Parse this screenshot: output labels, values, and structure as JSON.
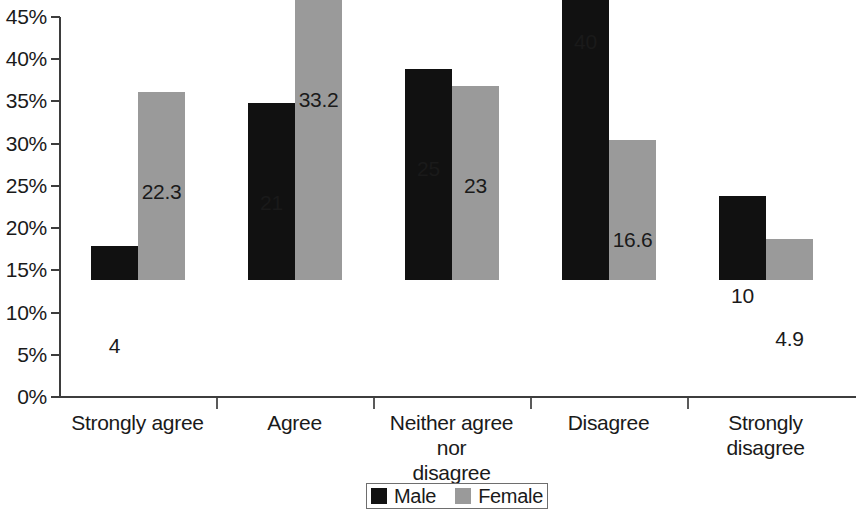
{
  "chart_data": {
    "type": "bar",
    "title": "",
    "subtitle": "",
    "xlabel": "",
    "ylabel": "",
    "categories": [
      "Strongly agree",
      "Agree",
      "Neither agree nor disagree",
      "Disagree",
      "Strongly disagree"
    ],
    "series": [
      {
        "name": "Male",
        "color": "#111111",
        "values": [
          4,
          21,
          25,
          40,
          10
        ],
        "labels": [
          "4",
          "21",
          "25",
          "40",
          "10"
        ]
      },
      {
        "name": "Female",
        "color": "#9a9a9a",
        "values": [
          22.3,
          33.2,
          23,
          16.6,
          4.9
        ],
        "labels": [
          "22.3",
          "33.2",
          "23",
          "16.6",
          "4.9"
        ]
      }
    ],
    "ylim": [
      0,
      45
    ],
    "ytick_step": 5,
    "ytick_labels": [
      "0%",
      "5%",
      "10%",
      "15%",
      "20%",
      "25%",
      "30%",
      "35%",
      "40%",
      "45%"
    ],
    "ytick_values": [
      0,
      5,
      10,
      15,
      20,
      25,
      30,
      35,
      40,
      45
    ],
    "grid": false,
    "legend_position": "bottom-center",
    "legend_entries": [
      "Male",
      "Female"
    ]
  },
  "axes": {
    "y_labels": [
      "45%",
      "40%",
      "35%",
      "30%",
      "25%",
      "20%",
      "15%",
      "10%",
      "5%",
      "0%"
    ],
    "x_labels": [
      {
        "line1": "Strongly agree",
        "line2": ""
      },
      {
        "line1": "Agree",
        "line2": ""
      },
      {
        "line1": "Neither agree nor",
        "line2": "disagree"
      },
      {
        "line1": "Disagree",
        "line2": ""
      },
      {
        "line1": "Strongly disagree",
        "line2": ""
      }
    ]
  },
  "legend": {
    "items": [
      {
        "label": "Male",
        "color": "#111111"
      },
      {
        "label": "Female",
        "color": "#9a9a9a"
      }
    ]
  },
  "colors": {
    "male": "#111111",
    "female": "#9a9a9a",
    "axis": "#3d3d3d",
    "text": "#1a1a1a",
    "background": "#ffffff"
  }
}
